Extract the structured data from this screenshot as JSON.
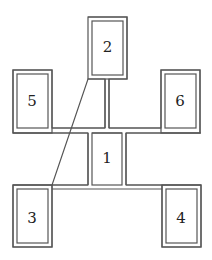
{
  "diagram": {
    "type": "double-line block layout",
    "stroke_color": "#555555",
    "background": "#ffffff",
    "boxes": [
      {
        "id": "1",
        "label": "1",
        "position": "center"
      },
      {
        "id": "2",
        "label": "2",
        "position": "top"
      },
      {
        "id": "3",
        "label": "3",
        "position": "bottom-left"
      },
      {
        "id": "4",
        "label": "4",
        "position": "bottom-right"
      },
      {
        "id": "5",
        "label": "5",
        "position": "middle-left"
      },
      {
        "id": "6",
        "label": "6",
        "position": "middle-right"
      }
    ]
  }
}
